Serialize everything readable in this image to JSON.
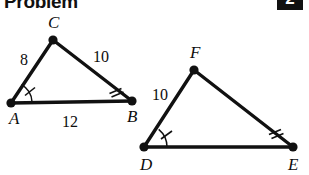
{
  "header": {
    "title": "Problem",
    "badge_number": "2"
  },
  "figure": {
    "stroke_color": "#111111",
    "label_color": "#0d0d0d",
    "background": "#ffffff",
    "triangles": [
      {
        "name": "triangle-abc",
        "vertices": [
          {
            "label": "A",
            "x": 11,
            "y": 103,
            "label_x": 9,
            "label_y": 124
          },
          {
            "label": "C",
            "x": 53,
            "y": 40,
            "label_x": 48,
            "label_y": 28
          },
          {
            "label": "B",
            "x": 132,
            "y": 101,
            "label_x": 127,
            "label_y": 122
          }
        ],
        "sides": [
          {
            "name": "side-ac",
            "from": "A",
            "to": "C",
            "length_label": "8",
            "label_x": 20,
            "label_y": 65
          },
          {
            "name": "side-cb",
            "from": "C",
            "to": "B",
            "length_label": "10",
            "label_x": 93,
            "label_y": 62
          },
          {
            "name": "side-ab",
            "from": "A",
            "to": "B",
            "length_label": "12",
            "label_x": 62,
            "label_y": 127
          }
        ],
        "angle_mark": {
          "at": "A",
          "ticks": 1
        },
        "side_mark": {
          "on": "side-cb",
          "ticks": 2
        }
      },
      {
        "name": "triangle-def",
        "vertices": [
          {
            "label": "D",
            "x": 144,
            "y": 147,
            "label_x": 140,
            "label_y": 170
          },
          {
            "label": "F",
            "x": 194,
            "y": 70,
            "label_x": 190,
            "label_y": 58
          },
          {
            "label": "E",
            "x": 293,
            "y": 147,
            "label_x": 288,
            "label_y": 170
          }
        ],
        "sides": [
          {
            "name": "side-df",
            "from": "D",
            "to": "F",
            "length_label": "10",
            "label_x": 152,
            "label_y": 100
          },
          {
            "name": "side-fe",
            "from": "F",
            "to": "E",
            "length_label": "",
            "label_x": 0,
            "label_y": 0
          },
          {
            "name": "side-de",
            "from": "D",
            "to": "E",
            "length_label": "",
            "label_x": 0,
            "label_y": 0
          }
        ],
        "angle_mark": {
          "at": "D",
          "ticks": 1
        },
        "side_mark": {
          "on": "side-fe",
          "ticks": 2
        }
      }
    ]
  }
}
